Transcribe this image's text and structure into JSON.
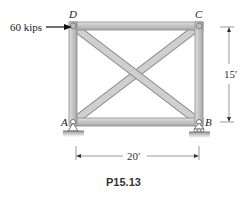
{
  "diagram": {
    "type": "truss",
    "caption": "P15.13",
    "load": {
      "label": "60 kips",
      "node": "D",
      "direction": "right"
    },
    "nodes": [
      {
        "id": "D",
        "label": "D"
      },
      {
        "id": "C",
        "label": "C"
      },
      {
        "id": "A",
        "label": "A",
        "support": "pin"
      },
      {
        "id": "B",
        "label": "B",
        "support": "roller"
      }
    ],
    "members": [
      "AD",
      "DC",
      "CB",
      "AB",
      "AC",
      "DB"
    ],
    "dimensions": {
      "height": "15′",
      "width": "20′"
    },
    "colors": {
      "member_fill": "#c8c8c8",
      "member_edge": "#8a8a8a",
      "ground": "#bdbdbd",
      "text": "#222222"
    }
  }
}
